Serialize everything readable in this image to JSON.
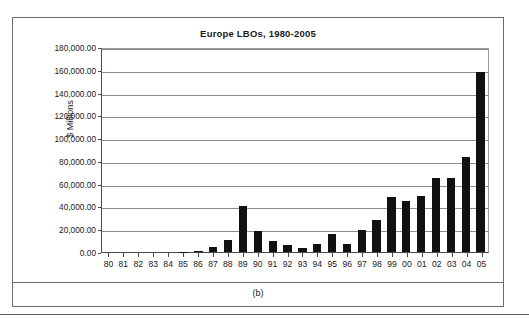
{
  "figure": {
    "caption": "(b)"
  },
  "chart_data": {
    "type": "bar",
    "title": "Europe LBOs, 1980-2005",
    "xlabel": "",
    "ylabel": "$ Millions",
    "ylim": [
      0,
      180000
    ],
    "grid": true,
    "legend": "none",
    "ytick_labels": [
      "180,000.00",
      "160,000.00",
      "140,000.00",
      "120,000.00",
      "100,000.00",
      "80,000.00",
      "60,000.00",
      "40,000.00",
      "20,000.00",
      "0.00"
    ],
    "ytick_values": [
      180000,
      160000,
      140000,
      120000,
      100000,
      80000,
      60000,
      40000,
      20000,
      0
    ],
    "categories": [
      "80",
      "81",
      "82",
      "83",
      "84",
      "85",
      "86",
      "87",
      "88",
      "89",
      "90",
      "91",
      "92",
      "93",
      "94",
      "95",
      "96",
      "97",
      "98",
      "99",
      "00",
      "01",
      "02",
      "03",
      "04",
      "05"
    ],
    "values": [
      0,
      0,
      0,
      0,
      0,
      400,
      600,
      4500,
      10500,
      40000,
      18500,
      9500,
      6500,
      3500,
      7000,
      15500,
      7000,
      19000,
      28000,
      48000,
      45000,
      49000,
      65000,
      65000,
      83000,
      158000
    ],
    "bar_color": "#111111"
  }
}
